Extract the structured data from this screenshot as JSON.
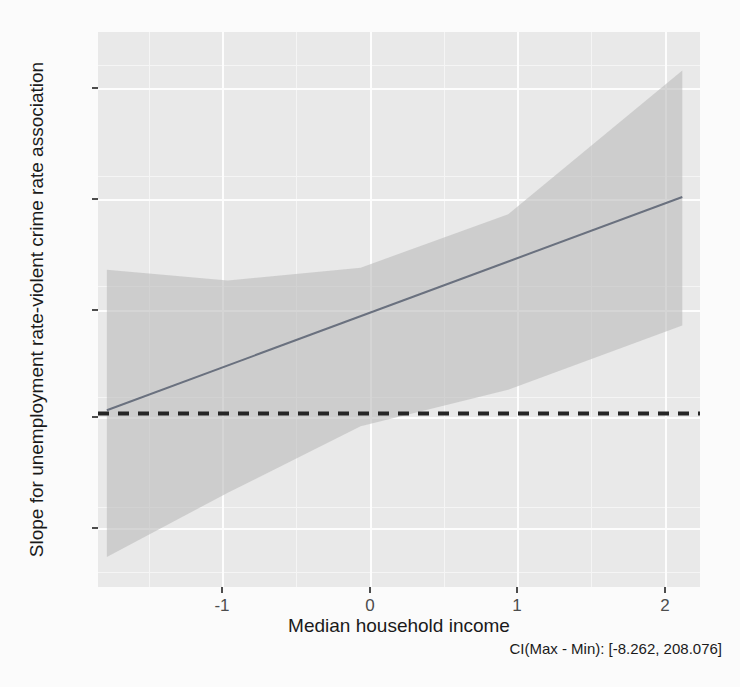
{
  "chart_data": {
    "type": "line",
    "title": "",
    "subtitle": "",
    "xlabel": "Median household income",
    "ylabel": "Slope for unemployment rate-violent crime rate association",
    "caption": "CI(Max - Min): [-8.262, 208.076]",
    "xlim": [
      -1.78,
      2.3
    ],
    "ylim": [
      -81,
      178
    ],
    "x_ticks": [
      "-1",
      "0",
      "1",
      "2"
    ],
    "x_tick_values": [
      -1,
      0,
      1,
      2
    ],
    "y_ticks": [
      "150",
      "100",
      "50",
      "0",
      "-50"
    ],
    "y_tick_values": [
      150,
      100,
      50,
      0,
      -50
    ],
    "grid": true,
    "legend": "none",
    "series": [
      {
        "name": "fitted-slope",
        "type": "line",
        "x": [
          -1.72,
          2.18
        ],
        "y": [
          1.5,
          101.0
        ],
        "color": "#6b7280"
      },
      {
        "name": "confidence-ribbon",
        "type": "area",
        "x": [
          -1.72,
          -0.9,
          0.0,
          1.0,
          2.18
        ],
        "ymin": [
          -67.0,
          -37.0,
          -6.0,
          11.0,
          41.0
        ],
        "ymax": [
          67.0,
          62.0,
          68.0,
          93.0,
          160.0
        ],
        "color": "#bfbfbf",
        "opacity": 0.55
      },
      {
        "name": "zero-reference-line",
        "type": "hline",
        "y": 0,
        "style": "dashed",
        "color": "#1a1a1a"
      }
    ],
    "annotations": [
      {
        "name": "ci-range-note",
        "text": "CI(Max - Min): [-8.262, 208.076]",
        "position": "bottom-right"
      }
    ],
    "colors": {
      "panel_background": "#ebebeb",
      "major_gridline": "#ffffff",
      "minor_gridline": "#f7f7f7",
      "ribbon": "#bfbfbf",
      "line": "#6b7280",
      "zero_line": "#1a1a1a",
      "axis_text": "#4d4d4d",
      "title_text": "#1a1a1a"
    }
  }
}
